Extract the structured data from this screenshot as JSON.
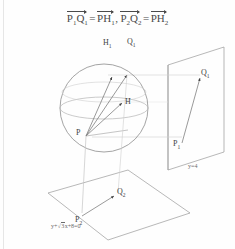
{
  "document": {
    "type": "geometry-figure",
    "header_equation": {
      "vectors": [
        {
          "name": "P1Q1",
          "base": "P",
          "base_sub": "1",
          "second": "Q",
          "second_sub": "1"
        },
        {
          "name": "PH1",
          "base": "P",
          "base_sub": "",
          "second": "H",
          "second_sub": "1"
        },
        {
          "name": "P2Q2",
          "base": "P",
          "base_sub": "2",
          "second": "Q",
          "second_sub": "2"
        },
        {
          "name": "PH2",
          "base": "P",
          "base_sub": "",
          "second": "H",
          "second_sub": "2"
        }
      ],
      "parts": {
        "p1": "P",
        "p1_sub": "1",
        "q1": "Q",
        "q1_sub": "1",
        "equals_1": "=",
        "p_a": "P",
        "h1": "H",
        "h1_sub": "1",
        "comma": ",",
        "p2": "P",
        "p2_sub": "2",
        "q2": "Q",
        "q2_sub": "2",
        "equals_2": "=",
        "p_b": "P",
        "h2": "H",
        "h2_sub": "2"
      }
    },
    "figure": {
      "sphere_labels": [
        {
          "id": "H1",
          "text": "H",
          "sub": "1"
        },
        {
          "id": "Q1",
          "text": "Q",
          "sub": "1"
        },
        {
          "id": "H",
          "text": "H",
          "sub": ""
        },
        {
          "id": "P",
          "text": "P",
          "sub": ""
        }
      ],
      "right_plane": {
        "labels": [
          {
            "id": "Q1p",
            "text": "Q",
            "sub": "1"
          },
          {
            "id": "P1p",
            "text": "P",
            "sub": "1"
          }
        ],
        "equation": {
          "lhs": "y",
          "operator": "=",
          "rhs": "4",
          "full": "y = 4"
        }
      },
      "bottom_plane": {
        "labels": [
          {
            "id": "Q2p",
            "text": "Q",
            "sub": "2"
          },
          {
            "id": "P2p",
            "text": "P",
            "sub": "2"
          }
        ],
        "equation": {
          "term1": "y",
          "plus1": "+",
          "sqrt": "√",
          "radicand": "3",
          "term2": "x",
          "plus2": "+",
          "term3": "8",
          "equals": "=",
          "rhs": "0",
          "full": "y + √3x + 8 = 0"
        }
      }
    },
    "colors": {
      "ink": "#3f3f3f",
      "line": "#8a8a8a",
      "faint_line": "#c9c9c9",
      "paper": "#fefefe"
    }
  }
}
